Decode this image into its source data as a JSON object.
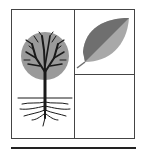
{
  "diagram": {
    "layout": "bordered box split into left panel and right column of two stacked panels, with a thick rule beneath",
    "panels": [
      {
        "id": "left",
        "content": "tree-with-roots",
        "icon": "tree-icon"
      },
      {
        "id": "top-right",
        "content": "leaf",
        "icon": "leaf-icon"
      },
      {
        "id": "bottom-right",
        "content": "empty"
      }
    ],
    "colors": {
      "line": "#444444",
      "baseline": "#222222",
      "canopy": "#9a9a9a",
      "branches": "#1a1a1a",
      "leaf_dark": "#6f6f6f",
      "leaf_light": "#a8a8a8"
    }
  }
}
